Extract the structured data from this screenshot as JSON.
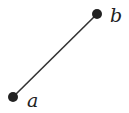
{
  "diagram": {
    "type": "line-segment",
    "points": [
      {
        "id": "a",
        "label": "a",
        "x": 13,
        "y": 97
      },
      {
        "id": "b",
        "label": "b",
        "x": 97,
        "y": 14
      }
    ],
    "edges": [
      {
        "from": "a",
        "to": "b"
      }
    ],
    "colors": {
      "stroke": "#333333",
      "point": "#222222",
      "label": "#222222",
      "background": "#ffffff"
    }
  }
}
